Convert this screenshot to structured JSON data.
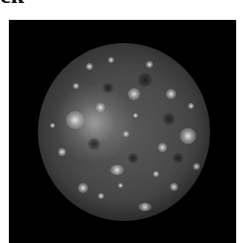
{
  "heading_fragment": {
    "text": "ck"
  },
  "figure": {
    "background_color": "#000000",
    "moon_color": "#4a4a4a",
    "highlight_color": "#e6e6e6"
  }
}
